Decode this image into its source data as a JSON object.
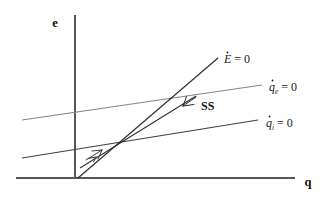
{
  "figure": {
    "kind": "phase-diagram",
    "background_color": "#ffffff",
    "axes": {
      "y_label": "e",
      "x_label": "q",
      "axis_color": "#4a4a4a",
      "origin": [
        75,
        178
      ]
    },
    "labels": {
      "e_dot_var": "E",
      "e_dot_rhs": " = 0",
      "q_e_var": "q",
      "q_e_sub": "e",
      "q_e_rhs": " = 0",
      "q_i_var": "q",
      "q_i_sub": "i",
      "q_i_rhs": " = 0",
      "ss": "SS"
    },
    "curves": [
      {
        "name": "E-dot-nullcline",
        "label": "Ė = 0",
        "color": "#2e2e2e",
        "slope_kind": "steep",
        "from": [
          78,
          178
        ],
        "to": [
          218,
          58
        ]
      },
      {
        "name": "q-e-nullcline",
        "label": "q̇e = 0",
        "color": "#7d7d7d",
        "slope_kind": "shallow",
        "from": [
          22,
          120
        ],
        "to": [
          262,
          85
        ]
      },
      {
        "name": "q-i-nullcline",
        "label": "q̇i = 0",
        "color": "#3a3a3a",
        "slope_kind": "shallow",
        "from": [
          22,
          158
        ],
        "to": [
          258,
          120
        ]
      },
      {
        "name": "saddle-path-SS",
        "label": "SS",
        "color": "#2e2e2e",
        "slope_kind": "medium",
        "from": [
          80,
          168
        ],
        "to": [
          196,
          96
        ]
      }
    ],
    "equilibrium_point": [
      115,
      145
    ],
    "trajectory_arrow": {
      "name": "convergence-arrow",
      "direction": "up-right",
      "at": [
        95,
        157
      ]
    },
    "ss_pointer": {
      "name": "ss-pointer-arrow",
      "from": [
        196,
        97
      ],
      "to": [
        182,
        107
      ]
    }
  }
}
